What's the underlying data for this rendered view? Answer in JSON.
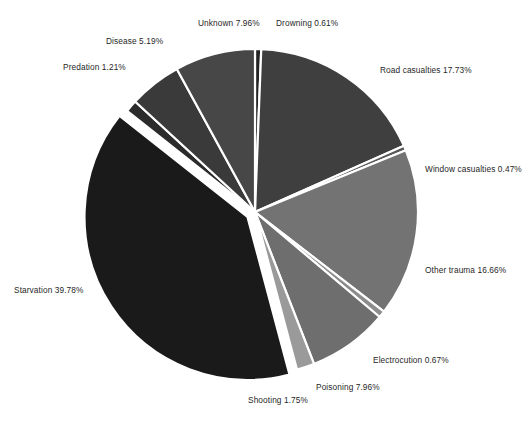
{
  "figure": {
    "background_color": "#ffffff",
    "caption": ""
  },
  "chart_data": {
    "type": "pie",
    "title": "",
    "xlabel": "",
    "ylabel": "",
    "legend_position": "none",
    "grid": false,
    "label_format": "{name} {value}%",
    "total": 100.0,
    "start_angle_deg": -90,
    "direction": "clockwise",
    "center": {
      "x": 255,
      "y": 212
    },
    "radius": 163,
    "categories": [
      "Drowning",
      "Road casualties",
      "Window casualties",
      "Other trauma",
      "Electrocution",
      "Poisoning",
      "Shooting",
      "Starvation",
      "Predation",
      "Disease",
      "Unknown"
    ],
    "values": [
      0.61,
      17.73,
      0.47,
      16.66,
      0.67,
      7.96,
      1.75,
      39.78,
      1.21,
      5.19,
      7.96
    ],
    "slices": [
      {
        "name": "Drowning",
        "value": 0.61,
        "label": "Drowning 0.61%",
        "color": "#232323",
        "exploded": false
      },
      {
        "name": "Road casualties",
        "value": 17.73,
        "label": "Road casualties 17.73%",
        "color": "#3f3f3f",
        "exploded": false
      },
      {
        "name": "Window casualties",
        "value": 0.47,
        "label": "Window casualties 0.47%",
        "color": "#585858",
        "exploded": false
      },
      {
        "name": "Other trauma",
        "value": 16.66,
        "label": "Other trauma 16.66%",
        "color": "#737373",
        "exploded": false
      },
      {
        "name": "Electrocution",
        "value": 0.67,
        "label": "Electrocution 0.67%",
        "color": "#8d8d8d",
        "exploded": false
      },
      {
        "name": "Poisoning",
        "value": 7.96,
        "label": "Poisoning 7.96%",
        "color": "#6e6e6e",
        "exploded": false
      },
      {
        "name": "Shooting",
        "value": 1.75,
        "label": "Shooting 1.75%",
        "color": "#9a9a9a",
        "exploded": false
      },
      {
        "name": "Starvation",
        "value": 39.78,
        "label": "Starvation 39.78%",
        "color": "#1a1a1a",
        "exploded": true
      },
      {
        "name": "Predation",
        "value": 1.21,
        "label": "Predation 1.21%",
        "color": "#2b2b2b",
        "exploded": false
      },
      {
        "name": "Disease",
        "value": 5.19,
        "label": "Disease 5.19%",
        "color": "#3a3a3a",
        "exploded": false
      },
      {
        "name": "Unknown",
        "value": 7.96,
        "label": "Unknown 7.96%",
        "color": "#474747",
        "exploded": false
      }
    ]
  }
}
